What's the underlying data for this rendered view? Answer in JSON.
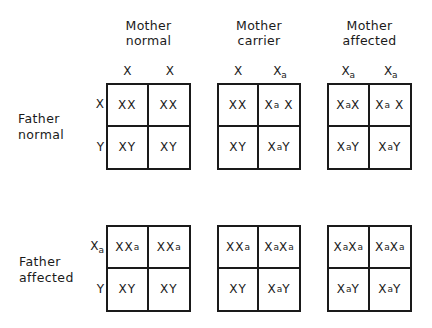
{
  "columns": [
    {
      "title_line1": "Mother",
      "title_line2": "normal",
      "alleles": [
        "X",
        "X"
      ]
    },
    {
      "title_line1": "Mother",
      "title_line2": "carrier",
      "alleles": [
        "X",
        "Xa"
      ]
    },
    {
      "title_line1": "Mother",
      "title_line2": "affected",
      "alleles": [
        "Xa",
        "Xa"
      ]
    }
  ],
  "rows": [
    {
      "title_line1": "Father",
      "title_line2": "normal",
      "alleles": [
        "X",
        "Y"
      ]
    },
    {
      "title_line1": "Father",
      "title_line2": "affected",
      "alleles": [
        "Xa",
        "Y"
      ]
    }
  ],
  "squares": [
    [
      [
        [
          "XX",
          "XX"
        ],
        [
          "XY",
          "XY"
        ]
      ],
      [
        [
          "XX",
          "Xa X"
        ],
        [
          "XY",
          "XaY"
        ]
      ],
      [
        [
          "XaX",
          "Xa X"
        ],
        [
          "XaY",
          "XaY"
        ]
      ]
    ],
    [
      [
        [
          "XXa",
          "XXa"
        ],
        [
          "XY",
          "XY"
        ]
      ],
      [
        [
          "XXa",
          "XaXa"
        ],
        [
          "XY",
          "XaY"
        ]
      ],
      [
        [
          "XaXa",
          "XaXa"
        ],
        [
          "XaY",
          "XaY"
        ]
      ]
    ]
  ],
  "notation": {
    "affected_allele_subscript": "a"
  }
}
